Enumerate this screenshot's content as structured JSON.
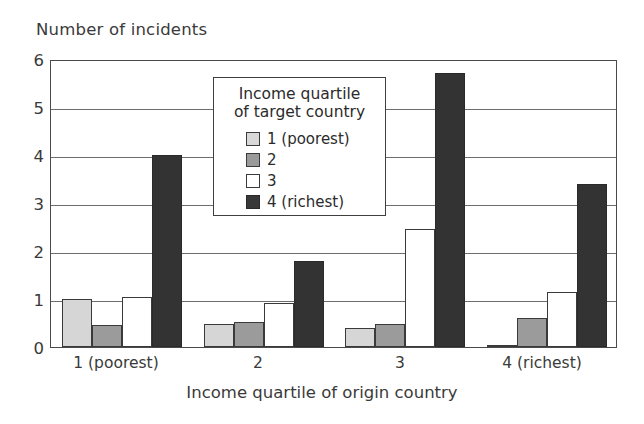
{
  "chart_data": {
    "type": "bar",
    "title": "",
    "ylabel": "Number of incidents",
    "xlabel": "Income quartile of origin country",
    "categories": [
      "1 (poorest)",
      "2",
      "3",
      "4 (richest)"
    ],
    "ylim": [
      0,
      6
    ],
    "yticks": [
      0,
      1,
      2,
      3,
      4,
      5,
      6
    ],
    "ytick_labels": [
      "0",
      "1",
      "2",
      "3",
      "4",
      "5",
      "6"
    ],
    "grid": "horizontal",
    "legend_position": "inside-top-center",
    "legend_title": "Income quartile of target country",
    "legend_title_line1": "Income quartile",
    "legend_title_line2": "of target country",
    "series": [
      {
        "name": "1 (poorest)",
        "color": "#d6d6d6",
        "values": [
          1.0,
          0.48,
          0.4,
          0.05
        ]
      },
      {
        "name": "2",
        "color": "#9b9b9b",
        "values": [
          0.45,
          0.52,
          0.47,
          0.6
        ]
      },
      {
        "name": "3",
        "color": "#ffffff",
        "values": [
          1.05,
          0.92,
          2.45,
          1.15
        ]
      },
      {
        "name": "4 (richest)",
        "color": "#333333",
        "values": [
          4.0,
          1.8,
          5.7,
          3.4
        ]
      }
    ]
  },
  "axes": {
    "ylabel": "Number of incidents",
    "xlabel": "Income quartile of origin country",
    "ytick_labels": [
      "0",
      "1",
      "2",
      "3",
      "4",
      "5",
      "6"
    ],
    "xtick_labels": [
      "1 (poorest)",
      "2",
      "3",
      "4 (richest)"
    ]
  },
  "legend": {
    "title_line1": "Income quartile",
    "title_line2": "of target country",
    "items": [
      {
        "label": "1 (poorest)",
        "color": "#d8d8d8"
      },
      {
        "label": "2",
        "color": "#9a9a9a"
      },
      {
        "label": "3",
        "color": "#ffffff"
      },
      {
        "label": "4 (richest)",
        "color": "#383838"
      }
    ]
  }
}
